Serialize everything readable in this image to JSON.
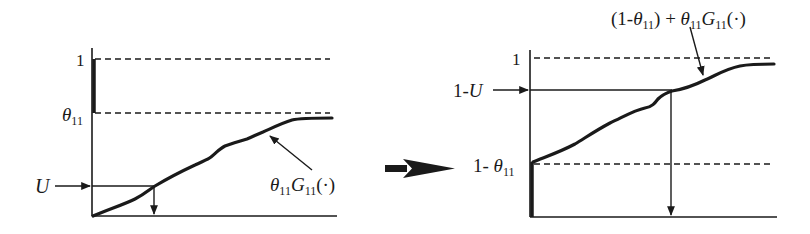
{
  "diagram": {
    "colors": {
      "ink": "#1a1a1a",
      "background": "#ffffff"
    },
    "left_panel": {
      "y_tick_one": "1",
      "y_tick_theta": "θ",
      "y_tick_theta_sub": "11",
      "input_label": "U",
      "curve_label": {
        "theta": "θ",
        "theta_sub": "11",
        "G": "G",
        "G_sub": "11",
        "arg": "(·)"
      }
    },
    "transition_arrow": "right-arrow",
    "right_panel": {
      "y_tick_one": "1",
      "y_tick_one_minus_u_prefix": "1-",
      "y_tick_one_minus_u_var": "U",
      "y_tick_one_minus_theta_prefix": "1- ",
      "y_tick_one_minus_theta_theta": "θ",
      "y_tick_one_minus_theta_sub": "11",
      "curve_label": {
        "prefix": "(1-",
        "theta1": "θ",
        "theta1_sub": "11",
        "middle": ") + ",
        "theta2": "θ",
        "theta2_sub": "11",
        "G": "G",
        "G_sub": "11",
        "arg": "(·)"
      }
    }
  }
}
